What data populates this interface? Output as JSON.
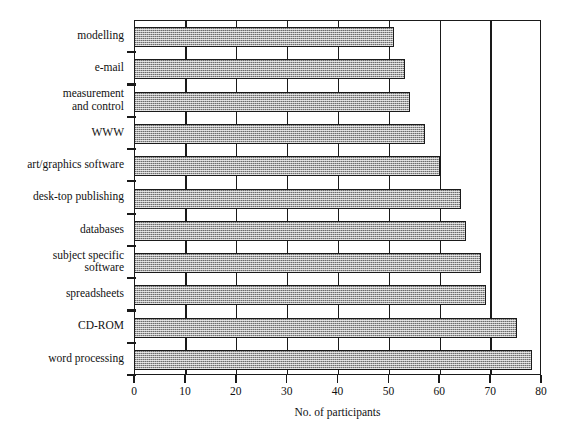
{
  "chart_data": {
    "type": "bar",
    "orientation": "horizontal",
    "title": "",
    "subtitle": "",
    "xlabel": "No. of participants",
    "ylabel": "",
    "xlim": [
      0,
      80
    ],
    "xticks": [
      0,
      10,
      20,
      30,
      40,
      50,
      60,
      70,
      80
    ],
    "xtick_labels": [
      "0",
      "10",
      "20",
      "30",
      "40",
      "50",
      "60",
      "70",
      "80"
    ],
    "grid": "vertical gridlines at every 10 units, drawn behind bars",
    "legend": "none",
    "bar_fill": "#a8a8a8",
    "bar_edge": "#1a1a1a",
    "categories": [
      "modelling",
      "e-mail",
      "measurement and control",
      "WWW",
      "art/graphics software",
      "desk-top publishing",
      "databases",
      "subject specific software",
      "spreadsheets",
      "CD-ROM",
      "word processing"
    ],
    "values": [
      51,
      53,
      54,
      57,
      60,
      64,
      65,
      68,
      69,
      75,
      78
    ]
  },
  "bars": [
    {
      "label_lines": [
        "modelling"
      ],
      "value": 51
    },
    {
      "label_lines": [
        "e-mail"
      ],
      "value": 53
    },
    {
      "label_lines": [
        "measurement",
        "and control"
      ],
      "value": 54
    },
    {
      "label_lines": [
        "WWW"
      ],
      "value": 57
    },
    {
      "label_lines": [
        "art/graphics software"
      ],
      "value": 60
    },
    {
      "label_lines": [
        "desk-top publishing"
      ],
      "value": 64
    },
    {
      "label_lines": [
        "databases"
      ],
      "value": 65
    },
    {
      "label_lines": [
        "subject specific",
        "software"
      ],
      "value": 68
    },
    {
      "label_lines": [
        "spreadsheets"
      ],
      "value": 69
    },
    {
      "label_lines": [
        "CD-ROM"
      ],
      "value": 75
    },
    {
      "label_lines": [
        "word processing"
      ],
      "value": 78
    }
  ],
  "axis": {
    "x_title": "No. of participants",
    "x_tick_labels": [
      "0",
      "10",
      "20",
      "30",
      "40",
      "50",
      "60",
      "70",
      "80"
    ],
    "x_min": 0,
    "x_max": 80
  },
  "colors": {
    "bar_fill": "#a8a8a8",
    "bar_edge": "#1a1a1a",
    "axis": "#1a1a1a",
    "background": "#ffffff",
    "text": "#111111"
  }
}
